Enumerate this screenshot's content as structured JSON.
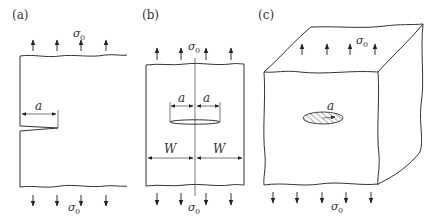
{
  "figure": {
    "panels": [
      {
        "id": "a",
        "label": "(a)",
        "description": "Edge crack in semi-infinite plate under remote tension",
        "dimension_labels": [
          "a"
        ],
        "stress_top": {
          "symbol": "σ",
          "subscript": "0"
        },
        "stress_bottom": {
          "symbol": "σ",
          "subscript": "0"
        }
      },
      {
        "id": "b",
        "label": "(b)",
        "description": "Center crack in finite-width plate under remote tension",
        "dimension_labels": [
          "a",
          "a",
          "W",
          "W"
        ],
        "stress_top": {
          "symbol": "σ",
          "subscript": "0"
        },
        "stress_bottom": {
          "symbol": "σ",
          "subscript": "0"
        }
      },
      {
        "id": "c",
        "label": "(c)",
        "description": "Embedded penny-shaped crack in a solid body under remote tension",
        "dimension_labels": [
          "a"
        ],
        "stress_top": {
          "symbol": "σ",
          "subscript": "0"
        },
        "stress_bottom": {
          "symbol": "σ",
          "subscript": "0"
        }
      }
    ],
    "colors": {
      "line": "#333333",
      "background": "#ffffff"
    }
  }
}
